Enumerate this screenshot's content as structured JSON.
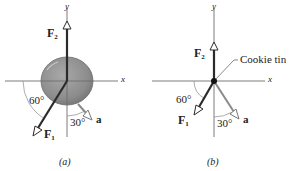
{
  "panels": [
    {
      "id": "a",
      "caption": "(a)",
      "axis_x": "x",
      "axis_y": "y",
      "force_1": {
        "letter": "F",
        "sub": "1"
      },
      "force_2": {
        "letter": "F",
        "sub": "2"
      },
      "accel_label": "a",
      "angle_f1": "60°",
      "angle_a": "30°",
      "object": "cookie tin (disk)"
    },
    {
      "id": "b",
      "caption": "(b)",
      "axis_x": "x",
      "axis_y": "y",
      "force_1": {
        "letter": "F",
        "sub": "1"
      },
      "force_2": {
        "letter": "F",
        "sub": "2"
      },
      "accel_label": "a",
      "angle_f1": "60°",
      "angle_a": "30°",
      "object_label": "Cookie tin"
    }
  ],
  "colors": {
    "axis": "#6e6e6e",
    "force": "#2b2b2b",
    "accel": "#8a8a8a",
    "disk": "#8f8f8f",
    "disk_edge": "#6b6b6b",
    "text": "#222222"
  }
}
